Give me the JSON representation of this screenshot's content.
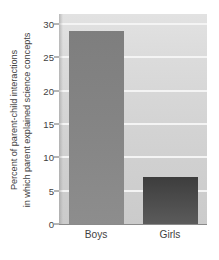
{
  "chart_data": {
    "type": "bar",
    "title": "",
    "xlabel": "",
    "ylabel_lines": [
      "Percent of parent-child interactions",
      "in which parent explained science concepts"
    ],
    "categories": [
      "Boys",
      "Girls"
    ],
    "values": [
      29,
      7
    ],
    "series": [
      {
        "name": "Percent of parent-child interactions in which parent explained science concepts",
        "values": [
          29,
          7
        ]
      }
    ],
    "ylim": [
      0,
      31.5
    ],
    "yticks": [
      0,
      5,
      10,
      15,
      20,
      25,
      30
    ],
    "ytick_labels": [
      "0",
      "5",
      "10",
      "15",
      "20",
      "25",
      "30"
    ],
    "grid": true,
    "grid_axis": "y",
    "legend": false,
    "legend_position": "none",
    "bar_colors": [
      "#848484",
      "#4c4c4c"
    ],
    "plot_background": "#d8d8d8",
    "gridline_color": "#f4f4f4",
    "axis_color": "#8a8a8a",
    "text_color": "#3f3f3f",
    "annotations": []
  }
}
